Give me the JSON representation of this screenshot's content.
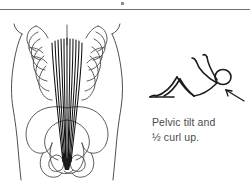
{
  "figure": {
    "caption_line_1": "Pelvic tilt and",
    "caption_line_2": "½ curl up.",
    "caption_full": "Pelvic tilt and ½ curl up.",
    "ink_color": "#1c1c1c",
    "outline_color": "#3b3b3b",
    "bone_color": "#4a4a4a",
    "muscle_color": "#111111",
    "caption_color": "#4a4a4a",
    "rule_color": "#6f6f6f",
    "background_color": "#ffffff"
  },
  "anatomy": {
    "label": "anterior torso with rectus abdominis",
    "torso_outline": "trunk silhouette narrowing at waist",
    "rib_count_per_side": 6,
    "muscle_fiber_count": 11,
    "muscle_insertion": "pubic symphysis",
    "pelvis_parts": [
      "iliac crest left",
      "iliac crest right",
      "pelvic inlet",
      "obturator foramen left",
      "obturator foramen right",
      "pubic symphysis"
    ]
  },
  "exercise": {
    "label": "stick figure half curl up",
    "pose": "supine, knees bent, arms reaching forward, head and shoulders lifted",
    "arrow": "pointer indicating abdominal contraction"
  }
}
